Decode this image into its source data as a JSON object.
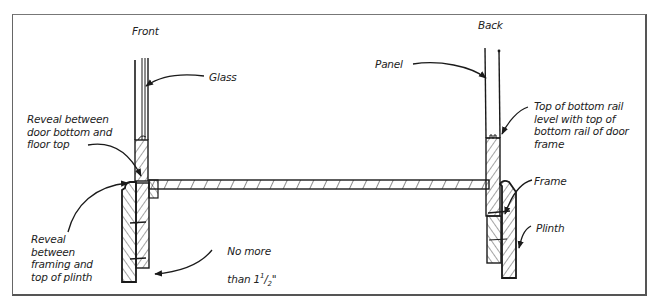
{
  "diagram": {
    "headings": {
      "front": "Front",
      "back": "Back"
    },
    "labels": {
      "glass": "Glass",
      "panel": "Panel",
      "reveal_door_floor": "Reveal between\ndoor bottom and\nfloor top",
      "reveal_framing_plinth": "Reveal\nbetween\nframing and\ntop of plinth",
      "no_more_than_line1": "No more",
      "no_more_than_prefix": "than 1",
      "no_more_than_num": "1",
      "no_more_than_den": "2",
      "no_more_than_suffix": "\"",
      "top_of_bottom_rail": "Top of bottom rail\nlevel with top of\nbottom rail of door\nframe",
      "frame": "Frame",
      "plinth": "Plinth"
    },
    "colors": {
      "ink": "#1a1a1a",
      "border": "#666666",
      "background": "#ffffff"
    }
  }
}
